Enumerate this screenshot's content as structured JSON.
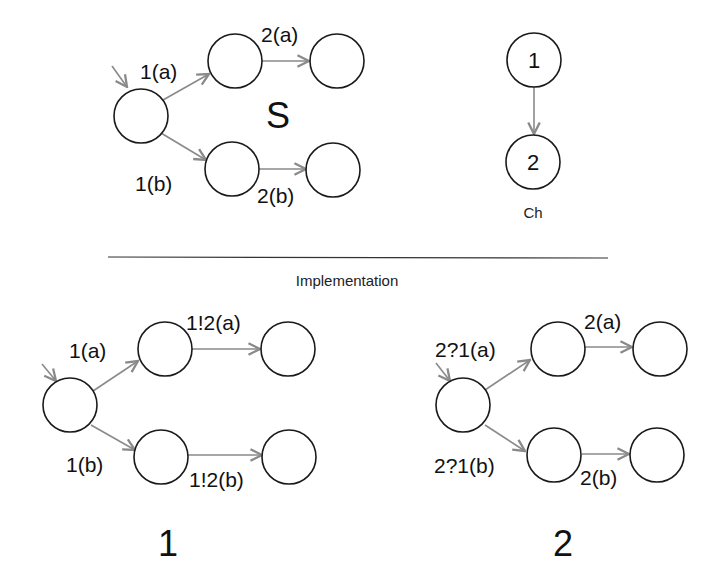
{
  "colors": {
    "edge": "#8a8a8a",
    "state_stroke": "#1a1a1a",
    "text": "#111111",
    "background": "#ffffff"
  },
  "spec": {
    "name": "S",
    "edge_labels": {
      "e1a": "1(a)",
      "e2a": "2(a)",
      "e1b": "1(b)",
      "e2b": "2(b)"
    }
  },
  "channel": {
    "name": "Ch",
    "nodes": [
      "1",
      "2"
    ]
  },
  "separator": {
    "label": "Implementation"
  },
  "impl1": {
    "name": "1",
    "edge_labels": {
      "e1a": "1(a)",
      "e2a": "1!2(a)",
      "e1b": "1(b)",
      "e2b": "1!2(b)"
    }
  },
  "impl2": {
    "name": "2",
    "edge_labels": {
      "e1a": "2?1(a)",
      "e2a": "2(a)",
      "e1b": "2?1(b)",
      "e2b": "2(b)"
    }
  }
}
